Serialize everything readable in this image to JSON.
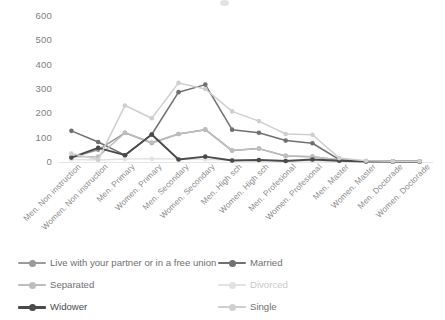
{
  "chart_data": {
    "type": "line",
    "title": "",
    "xlabel": "",
    "ylabel": "",
    "ylim": [
      0,
      600
    ],
    "yticks": [
      0,
      100,
      200,
      300,
      400,
      500,
      600
    ],
    "grid": false,
    "legend_position": "bottom",
    "categories": [
      "Men. Non instruction",
      "Women. Non instruction",
      "Men. Primary",
      "Women. Primary",
      "Men. Secondary",
      "Women. Secondary",
      "Men. High sch",
      "Women. High sch",
      "Men. Profesional",
      "Women. Profesional",
      "Men. Master",
      "Women. Master",
      "Men. Doctorade",
      "Women. Doctorade"
    ],
    "series": [
      {
        "name": "Live with your partner or in a free union",
        "color": "#9a9a9a",
        "values": [
          18,
          50,
          120,
          78,
          115,
          133,
          47,
          55,
          25,
          22,
          8,
          3,
          2,
          2
        ]
      },
      {
        "name": "Married",
        "color": "#707070",
        "values": [
          128,
          82,
          28,
          113,
          287,
          318,
          133,
          120,
          88,
          77,
          10,
          3,
          2,
          2
        ]
      },
      {
        "name": "Separated",
        "color": "#bdbdbd",
        "values": [
          22,
          22,
          120,
          80,
          115,
          133,
          47,
          55,
          25,
          22,
          8,
          3,
          2,
          2
        ]
      },
      {
        "name": "Divorced",
        "color": "#e2e2e2",
        "values": [
          10,
          8,
          12,
          13,
          12,
          10,
          8,
          8,
          6,
          5,
          3,
          2,
          2,
          2
        ]
      },
      {
        "name": "Widower",
        "color": "#4a4a4a",
        "values": [
          18,
          58,
          28,
          113,
          10,
          22,
          6,
          8,
          4,
          10,
          5,
          2,
          2,
          2
        ]
      },
      {
        "name": "Single",
        "color": "#cfcfcf",
        "values": [
          35,
          10,
          232,
          180,
          325,
          300,
          208,
          168,
          115,
          112,
          16,
          5,
          3,
          3
        ]
      }
    ]
  },
  "legend": {
    "items": [
      {
        "label": "Live with your partner or in a free union",
        "color": "#9a9a9a"
      },
      {
        "label": "Married",
        "color": "#707070"
      },
      {
        "label": "Separated",
        "color": "#bdbdbd"
      },
      {
        "label": "Divorced",
        "color": "#e2e2e2"
      },
      {
        "label": "Widower",
        "color": "#4a4a4a"
      },
      {
        "label": "Single",
        "color": "#cfcfcf"
      }
    ]
  }
}
